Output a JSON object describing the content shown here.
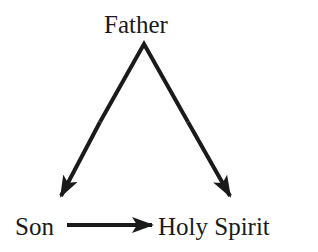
{
  "diagram": {
    "nodes": {
      "top": "Father",
      "bottom_left": "Son",
      "bottom_right": "Holy Spirit"
    },
    "edges": [
      {
        "from": "Father",
        "to": "Son"
      },
      {
        "from": "Father",
        "to": "Holy Spirit"
      },
      {
        "from": "Son",
        "to": "Holy Spirit"
      }
    ],
    "colors": {
      "stroke": "#1a1a1a",
      "background": "#ffffff"
    }
  }
}
